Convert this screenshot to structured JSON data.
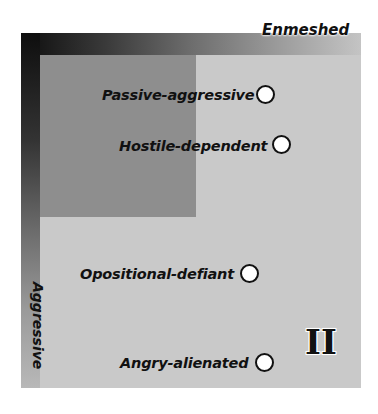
{
  "diagram": {
    "axes": {
      "top_label": "Enmeshed",
      "left_label": "Aggressive"
    },
    "quadrant_label": "II",
    "items": [
      {
        "label": "Passive-aggressive",
        "marker": "open-circle"
      },
      {
        "label": "Hostile-dependent",
        "marker": "open-circle"
      },
      {
        "label": "Opositional-defiant",
        "marker": "open-circle"
      },
      {
        "label": "Angry-alienated",
        "marker": "open-circle"
      }
    ],
    "colors": {
      "panel": "#c9c9c9",
      "inner_square": "#8e8e8e",
      "gradient_dark": "#0e0e0e",
      "gradient_light": "#c4c4c4",
      "marker_fill": "#ffffff",
      "text": "#111111"
    }
  }
}
